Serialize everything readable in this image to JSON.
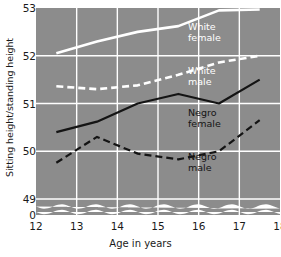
{
  "chart_data": {
    "type": "line",
    "title": "",
    "xlabel": "Age in years",
    "ylabel": "Sitting height/standing height",
    "xlim": [
      12,
      18
    ],
    "ylim": [
      48.85,
      53.0
    ],
    "xticks": [
      "12",
      "13",
      "14",
      "15",
      "16",
      "17",
      "18"
    ],
    "yticks": [
      "0",
      "49",
      "50",
      "51",
      "52",
      "53"
    ],
    "grid": true,
    "axis_break": true,
    "legend_position": "inline-annotations",
    "plot_background": "#8c8c8c",
    "grid_color": "#ffffff",
    "x": [
      12.5,
      13.5,
      14.5,
      15.5,
      16.5,
      17.5
    ],
    "series": [
      {
        "name": "White female",
        "label_lines": [
          "White",
          "female"
        ],
        "style": "solid",
        "color": "#ffffff",
        "values": [
          52.05,
          52.3,
          52.5,
          52.62,
          52.95,
          52.97
        ]
      },
      {
        "name": "White male",
        "label_lines": [
          "White",
          "male"
        ],
        "style": "dashed",
        "color": "#ffffff",
        "values": [
          51.36,
          51.3,
          51.38,
          51.6,
          51.86,
          52.0
        ]
      },
      {
        "name": "Negro female",
        "label_lines": [
          "Negro",
          "female"
        ],
        "style": "solid",
        "color": "#141414",
        "values": [
          50.4,
          50.62,
          51.0,
          51.2,
          51.0,
          51.5
        ]
      },
      {
        "name": "Negro male",
        "label_lines": [
          "Negro",
          "male"
        ],
        "style": "dashed",
        "color": "#141414",
        "values": [
          49.76,
          50.3,
          49.95,
          49.83,
          50.0,
          50.65
        ]
      }
    ]
  }
}
